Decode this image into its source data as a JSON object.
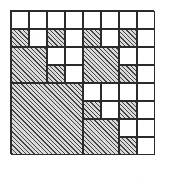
{
  "figure": {
    "type": "grid-tiling-diagram",
    "grid": {
      "columns": 8,
      "rows": 8,
      "cell_size_px": 18,
      "origin_x_px": 10,
      "origin_y_px": 10
    },
    "colors": {
      "background": "#ffffff",
      "line": "#2b2b2b",
      "shaded_fill": "#d9d9d9",
      "hatch_stroke": "#3c3c3c"
    },
    "legend": {
      "shaded_label": "shaded block",
      "empty_label": "empty cell"
    },
    "tiles": [
      {
        "name": "r1c1",
        "col": 1,
        "row": 1,
        "w": 1,
        "h": 1,
        "shaded": false
      },
      {
        "name": "r1c2",
        "col": 2,
        "row": 1,
        "w": 1,
        "h": 1,
        "shaded": false
      },
      {
        "name": "r1c3",
        "col": 3,
        "row": 1,
        "w": 1,
        "h": 1,
        "shaded": false
      },
      {
        "name": "r1c4",
        "col": 4,
        "row": 1,
        "w": 1,
        "h": 1,
        "shaded": false
      },
      {
        "name": "r1c5",
        "col": 5,
        "row": 1,
        "w": 1,
        "h": 1,
        "shaded": false
      },
      {
        "name": "r1c6",
        "col": 6,
        "row": 1,
        "w": 1,
        "h": 1,
        "shaded": false
      },
      {
        "name": "r1c7",
        "col": 7,
        "row": 1,
        "w": 1,
        "h": 1,
        "shaded": false
      },
      {
        "name": "r1c8",
        "col": 8,
        "row": 1,
        "w": 1,
        "h": 1,
        "shaded": false
      },
      {
        "name": "r2c1",
        "col": 1,
        "row": 2,
        "w": 1,
        "h": 1,
        "shaded": true
      },
      {
        "name": "r2c2",
        "col": 2,
        "row": 2,
        "w": 1,
        "h": 1,
        "shaded": false
      },
      {
        "name": "r2c3",
        "col": 3,
        "row": 2,
        "w": 1,
        "h": 1,
        "shaded": true
      },
      {
        "name": "r2c4",
        "col": 4,
        "row": 2,
        "w": 1,
        "h": 1,
        "shaded": false
      },
      {
        "name": "r2c5",
        "col": 5,
        "row": 2,
        "w": 1,
        "h": 1,
        "shaded": true
      },
      {
        "name": "r2c6",
        "col": 6,
        "row": 2,
        "w": 1,
        "h": 1,
        "shaded": false
      },
      {
        "name": "r2c7",
        "col": 7,
        "row": 2,
        "w": 1,
        "h": 1,
        "shaded": true
      },
      {
        "name": "r2c8",
        "col": 8,
        "row": 2,
        "w": 1,
        "h": 1,
        "shaded": false
      },
      {
        "name": "block-r3c1-2x2",
        "col": 1,
        "row": 3,
        "w": 2,
        "h": 2,
        "shaded": true
      },
      {
        "name": "r3c3",
        "col": 3,
        "row": 3,
        "w": 1,
        "h": 1,
        "shaded": false
      },
      {
        "name": "r3c4",
        "col": 4,
        "row": 3,
        "w": 1,
        "h": 1,
        "shaded": false
      },
      {
        "name": "block-r3c5-2x2",
        "col": 5,
        "row": 3,
        "w": 2,
        "h": 2,
        "shaded": true
      },
      {
        "name": "r3c7",
        "col": 7,
        "row": 3,
        "w": 1,
        "h": 1,
        "shaded": false
      },
      {
        "name": "r3c8",
        "col": 8,
        "row": 3,
        "w": 1,
        "h": 1,
        "shaded": false
      },
      {
        "name": "r4c3",
        "col": 3,
        "row": 4,
        "w": 1,
        "h": 1,
        "shaded": true
      },
      {
        "name": "r4c4",
        "col": 4,
        "row": 4,
        "w": 1,
        "h": 1,
        "shaded": false
      },
      {
        "name": "r4c7",
        "col": 7,
        "row": 4,
        "w": 1,
        "h": 1,
        "shaded": true
      },
      {
        "name": "r4c8",
        "col": 8,
        "row": 4,
        "w": 1,
        "h": 1,
        "shaded": false
      },
      {
        "name": "block-r5c1-4x4",
        "col": 1,
        "row": 5,
        "w": 4,
        "h": 4,
        "shaded": true
      },
      {
        "name": "r5c5",
        "col": 5,
        "row": 5,
        "w": 1,
        "h": 1,
        "shaded": false
      },
      {
        "name": "r5c6",
        "col": 6,
        "row": 5,
        "w": 1,
        "h": 1,
        "shaded": false
      },
      {
        "name": "r5c7",
        "col": 7,
        "row": 5,
        "w": 1,
        "h": 1,
        "shaded": false
      },
      {
        "name": "r5c8",
        "col": 8,
        "row": 5,
        "w": 1,
        "h": 1,
        "shaded": false
      },
      {
        "name": "r6c5",
        "col": 5,
        "row": 6,
        "w": 1,
        "h": 1,
        "shaded": true
      },
      {
        "name": "r6c6",
        "col": 6,
        "row": 6,
        "w": 1,
        "h": 1,
        "shaded": false
      },
      {
        "name": "r6c7",
        "col": 7,
        "row": 6,
        "w": 1,
        "h": 1,
        "shaded": true
      },
      {
        "name": "r6c8",
        "col": 8,
        "row": 6,
        "w": 1,
        "h": 1,
        "shaded": false
      },
      {
        "name": "block-r7c5-2x2",
        "col": 5,
        "row": 7,
        "w": 2,
        "h": 2,
        "shaded": true
      },
      {
        "name": "r7c7",
        "col": 7,
        "row": 7,
        "w": 1,
        "h": 1,
        "shaded": false
      },
      {
        "name": "r7c8",
        "col": 8,
        "row": 7,
        "w": 1,
        "h": 1,
        "shaded": false
      },
      {
        "name": "r8c7",
        "col": 7,
        "row": 8,
        "w": 1,
        "h": 1,
        "shaded": true
      },
      {
        "name": "r8c8",
        "col": 8,
        "row": 8,
        "w": 1,
        "h": 1,
        "shaded": false
      }
    ]
  }
}
